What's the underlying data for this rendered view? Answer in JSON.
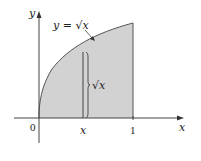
{
  "diagram": {
    "curve_label": "y = √x",
    "strip_label": "√x",
    "axes": {
      "x_label": "x",
      "y_label": "y",
      "origin_label": "0",
      "x_tick_labels": [
        "x",
        "1"
      ]
    },
    "colors": {
      "shaded_region": "#d2d2d2",
      "lines": "#444444",
      "text": "#222222"
    }
  }
}
